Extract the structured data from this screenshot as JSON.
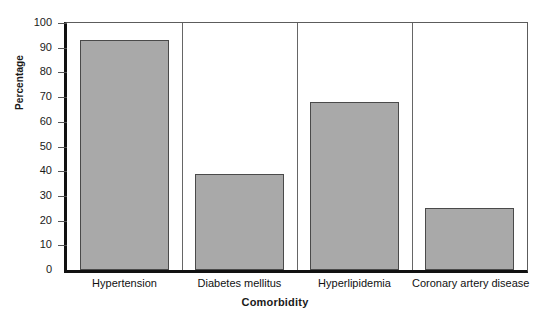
{
  "chart_data": {
    "type": "bar",
    "title": "",
    "xlabel": "Comorbidity",
    "ylabel": "Percentage",
    "categories": [
      "Hypertension",
      "Diabetes mellitus",
      "Hyperlipidemia",
      "Coronary artery disease"
    ],
    "values": [
      93,
      39,
      68,
      25
    ],
    "ylim": [
      0,
      100
    ],
    "yticks": [
      0,
      10,
      20,
      30,
      40,
      50,
      60,
      70,
      80,
      90,
      100
    ],
    "ytick_labels": [
      "0",
      "10",
      "20",
      "30",
      "40",
      "50",
      "60",
      "70",
      "80",
      "90",
      "100"
    ],
    "grid": false,
    "legend": null,
    "bar_color": "#a9a9a9",
    "bar_edge_color": "#4a4a4a",
    "axis_color": "#111111",
    "background_color": "#ffffff"
  }
}
